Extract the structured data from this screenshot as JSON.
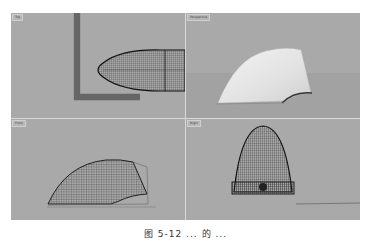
{
  "viewports": [
    {
      "label": "Top",
      "shape": "wireframe-bullet-side"
    },
    {
      "label": "Perspective",
      "shape": "shaded-fin-surface"
    },
    {
      "label": "Front",
      "shape": "wireframe-fin-surface"
    },
    {
      "label": "Right",
      "shape": "wireframe-parabola-front"
    }
  ],
  "colors": {
    "viewport_bg": "#a9a9a9",
    "border": "#d9d9d9",
    "wire": "#1e1e1e",
    "surface": "#e8e8e8"
  },
  "caption": "图 5-12  ... 的 ..."
}
